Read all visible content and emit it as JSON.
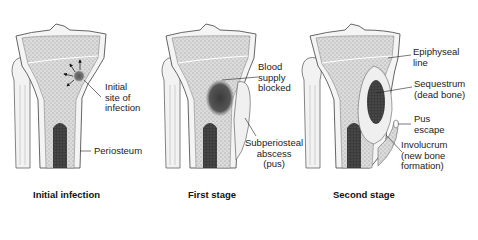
{
  "figure": {
    "panels": [
      {
        "caption": "Initial infection",
        "labels": [
          {
            "text": "Initial\nsite of\ninfection"
          },
          {
            "text": "Periosteum"
          }
        ]
      },
      {
        "caption": "First stage",
        "labels": [
          {
            "text": "Blood\nsupply\nblocked"
          },
          {
            "text": "Subperiosteal\nabscess\n(pus)"
          }
        ]
      },
      {
        "caption": "Second stage",
        "labels": [
          {
            "text": "Epiphyseal\nline"
          },
          {
            "text": "Sequestrum\n(dead bone)"
          },
          {
            "text": "Pus\nescape"
          },
          {
            "text": "Involucrum\n(new bone\nformation)"
          }
        ]
      }
    ]
  },
  "colors": {
    "outline": "#555555",
    "spongy_bone": "#d9d9d9",
    "marrow": "#3a3a3a",
    "infection": "#6a6a6a",
    "pus": "#efefef"
  }
}
